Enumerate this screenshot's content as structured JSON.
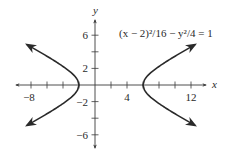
{
  "chart_data": {
    "type": "line",
    "title": "",
    "equation_label": "(x − 2)²/16 − y²/4 = 1",
    "xlabel": "x",
    "ylabel": "y",
    "xlim": [
      -9.5,
      15
    ],
    "ylim": [
      -7.5,
      8.5
    ],
    "x_ticks": [
      -8,
      -6,
      -4,
      -2,
      2,
      4,
      6,
      8,
      10,
      12
    ],
    "x_tick_labels": [
      {
        "value": -8,
        "label": "−8"
      },
      {
        "value": 4,
        "label": "4"
      },
      {
        "value": 12,
        "label": "12"
      }
    ],
    "y_ticks": [
      -6,
      -4,
      -2,
      2,
      4,
      6
    ],
    "y_tick_labels": [
      {
        "value": 6,
        "label": "6"
      },
      {
        "value": 2,
        "label": "2"
      },
      {
        "value": -2,
        "label": "−2"
      },
      {
        "value": -6,
        "label": "−6"
      }
    ],
    "grid": false,
    "hyperbola": {
      "h": 2,
      "k": 0,
      "a": 4,
      "b": 2,
      "orientation": "horizontal"
    },
    "series": [
      {
        "name": "left-branch",
        "x_range": [
          -8.5,
          -2
        ],
        "arrows": true
      },
      {
        "name": "right-branch",
        "x_range": [
          6,
          12.5
        ],
        "arrows": true
      }
    ],
    "colors": {
      "curve": "#2a2a2a",
      "axis": "#3a3a3a"
    }
  }
}
